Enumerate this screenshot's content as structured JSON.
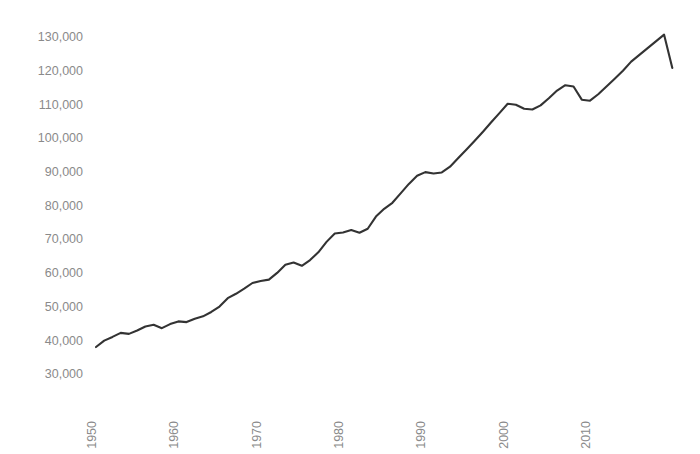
{
  "chart_data": {
    "type": "line",
    "title": "",
    "subtitle": "",
    "xlabel": "",
    "ylabel": "",
    "grid": false,
    "legend": "none",
    "line_color": "#333333",
    "tick_color": "#8a8a8a",
    "background_color": "#ffffff",
    "xlim": [
      1948,
      2021
    ],
    "ylim": [
      30000,
      133000
    ],
    "ytick_labels": [
      "130,000",
      "120,000",
      "110,000",
      "100,000",
      "90,000",
      "80,000",
      "70,000",
      "60,000",
      "50,000",
      "40,000",
      "30,000"
    ],
    "ytick_values": [
      130000,
      120000,
      110000,
      100000,
      90000,
      80000,
      70000,
      60000,
      50000,
      40000,
      30000
    ],
    "xtick_labels": [
      "1950",
      "1960",
      "1970",
      "1980",
      "1990",
      "2000",
      "2010"
    ],
    "xtick_values": [
      1950,
      1960,
      1970,
      1980,
      1990,
      2000,
      2010
    ],
    "xtick_rotation": 90,
    "series": [
      {
        "name": "Employment",
        "x": [
          1950,
          1951,
          1952,
          1953,
          1954,
          1955,
          1956,
          1957,
          1958,
          1959,
          1960,
          1961,
          1962,
          1963,
          1964,
          1965,
          1966,
          1967,
          1968,
          1969,
          1970,
          1971,
          1972,
          1973,
          1974,
          1975,
          1976,
          1977,
          1978,
          1979,
          1980,
          1981,
          1982,
          1983,
          1984,
          1985,
          1986,
          1987,
          1988,
          1989,
          1990,
          1991,
          1992,
          1993,
          1994,
          1995,
          1996,
          1997,
          1998,
          1999,
          2000,
          2001,
          2002,
          2003,
          2004,
          2005,
          2006,
          2007,
          2008,
          2009,
          2010,
          2011,
          2012,
          2013,
          2014,
          2015,
          2016,
          2017,
          2018,
          2019,
          2020
        ],
        "values": [
          38300,
          40200,
          41300,
          42500,
          42200,
          43200,
          44400,
          44900,
          43900,
          45100,
          45900,
          45700,
          46700,
          47400,
          48700,
          50300,
          52800,
          54100,
          55600,
          57300,
          57900,
          58300,
          60300,
          62700,
          63400,
          62400,
          64100,
          66400,
          69500,
          72000,
          72300,
          73000,
          72200,
          73400,
          77000,
          79300,
          81100,
          83900,
          86700,
          89100,
          90200,
          89800,
          90100,
          91800,
          94400,
          96900,
          99500,
          102200,
          105000,
          107700,
          110500,
          110200,
          109000,
          108800,
          110000,
          112100,
          114400,
          116000,
          115600,
          111700,
          111400,
          113300,
          115600,
          117900,
          120300,
          123000,
          125000,
          127000,
          129000,
          131000,
          121100
        ]
      }
    ]
  },
  "axes": {
    "y_axis_name": "employment-axis",
    "x_axis_name": "year-axis"
  }
}
